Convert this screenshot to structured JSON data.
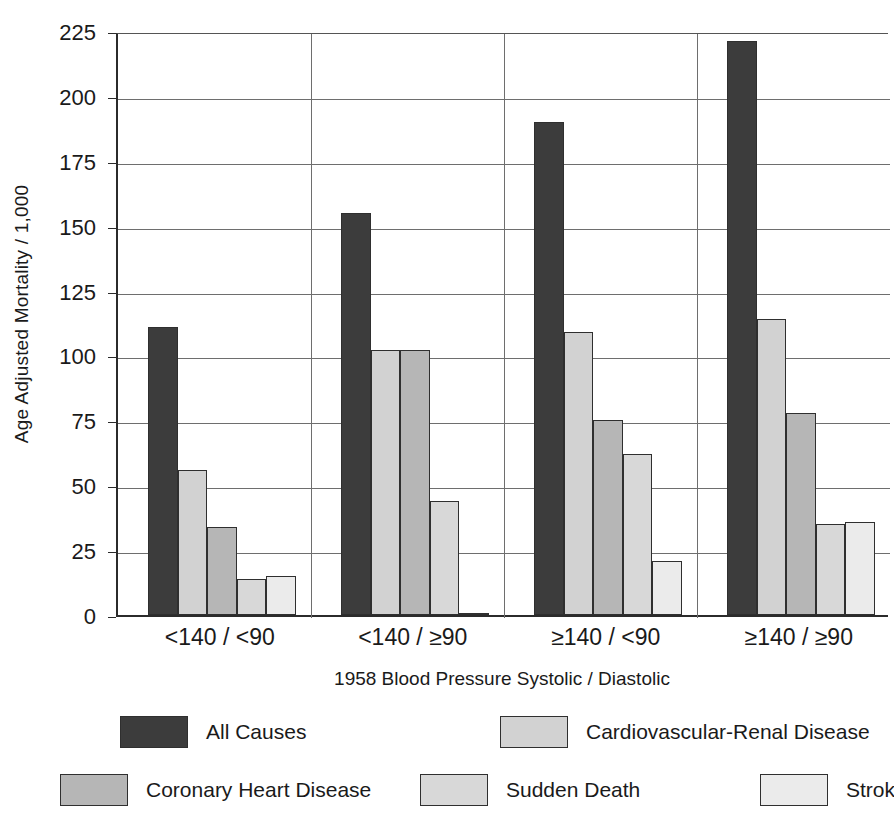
{
  "chart_data": {
    "type": "bar",
    "title": "",
    "xlabel": "1958 Blood Pressure  Systolic / Diastolic",
    "ylabel": "Age Adjusted Mortality / 1,000",
    "categories": [
      "<140 / <90",
      "<140 / ≥90",
      "≥140 / <90",
      "≥140 / ≥90"
    ],
    "ylim": [
      0,
      225
    ],
    "yticks": [
      0,
      25,
      50,
      75,
      100,
      125,
      150,
      175,
      200,
      225
    ],
    "grid": true,
    "legend_position": "bottom",
    "series": [
      {
        "name": "All Causes",
        "color": "#3c3c3c",
        "values": [
          111,
          155,
          190,
          221
        ]
      },
      {
        "name": "Cardiovascular-Renal Disease",
        "color": "#d2d2d2",
        "values": [
          56,
          102,
          109,
          114
        ]
      },
      {
        "name": "Coronary Heart Disease",
        "color": "#b6b6b6",
        "values": [
          34,
          102,
          75,
          78
        ]
      },
      {
        "name": "Sudden Death",
        "color": "#d8d8d8",
        "values": [
          14,
          44,
          62,
          35
        ]
      },
      {
        "name": "Stroke",
        "color": "#ebebeb",
        "values": [
          15,
          0.5,
          21,
          36
        ]
      }
    ]
  },
  "axis": {
    "y_title": "Age Adjusted Mortality / 1,000",
    "x_title": "1958 Blood Pressure  Systolic / Diastolic",
    "y_tick_labels": [
      "225",
      "200",
      "175",
      "150",
      "125",
      "100",
      "75",
      "50",
      "25",
      "0"
    ],
    "x_tick_labels": [
      "<140 / <90",
      "<140 / ≥90",
      "≥140 / <90",
      "≥140 / ≥90"
    ]
  },
  "legend": {
    "rows": [
      [
        {
          "label": "All Causes",
          "color": "#3c3c3c"
        },
        {
          "label": "Cardiovascular-Renal Disease",
          "color": "#d2d2d2"
        }
      ],
      [
        {
          "label": "Coronary Heart Disease",
          "color": "#b6b6b6"
        },
        {
          "label": "Sudden Death",
          "color": "#d8d8d8"
        },
        {
          "label": "Stroke",
          "color": "#ebebeb"
        }
      ]
    ]
  }
}
